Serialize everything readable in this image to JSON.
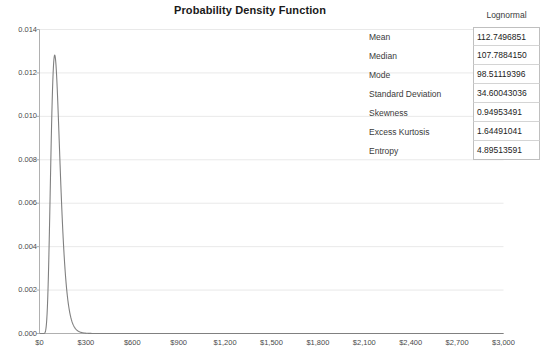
{
  "chart_data": {
    "type": "line",
    "title": "Probability Density Function",
    "xlabel": "",
    "ylabel": "",
    "xlim": [
      0,
      3000
    ],
    "ylim": [
      0,
      0.014
    ],
    "grid": true,
    "legend": "none",
    "distribution": "Lognormal",
    "distribution_params": {
      "mu": 4.6799,
      "sigma": 0.3024
    },
    "x_ticks": [
      "$0",
      "$300",
      "$600",
      "$900",
      "$1,200",
      "$1,500",
      "$1,800",
      "$2,100",
      "$2,400",
      "$2,700",
      "$3,000"
    ],
    "x_tick_values": [
      0,
      300,
      600,
      900,
      1200,
      1500,
      1800,
      2100,
      2400,
      2700,
      3000
    ],
    "y_ticks": [
      "0.000",
      "0.002",
      "0.004",
      "0.006",
      "0.008",
      "0.010",
      "0.012",
      "0.014"
    ],
    "y_tick_values": [
      0.0,
      0.002,
      0.004,
      0.006,
      0.008,
      0.01,
      0.012,
      0.014
    ],
    "series": [
      {
        "name": "Lognormal PDF",
        "color": "#808080",
        "peak_x": 98.51,
        "peak_y": 0.01305
      }
    ]
  },
  "stats": {
    "header": "Lognormal",
    "rows": [
      {
        "name": "Mean",
        "value": "112.7496851"
      },
      {
        "name": "Median",
        "value": "107.7884150"
      },
      {
        "name": "Mode",
        "value": "98.51119396"
      },
      {
        "name": "Standard Deviation",
        "value": "34.60043036"
      },
      {
        "name": "Skewness",
        "value": "0.94953491"
      },
      {
        "name": "Excess Kurtosis",
        "value": "1.64491041"
      },
      {
        "name": "Entropy",
        "value": "4.89513591"
      }
    ]
  },
  "colors": {
    "curve": "#808080",
    "grid": "#e9e9e9",
    "axis": "#b0b0b0",
    "text": "#3a3a3a"
  }
}
